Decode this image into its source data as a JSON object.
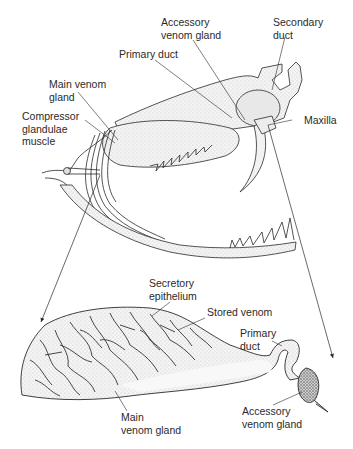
{
  "figure": {
    "top_panel": {
      "name": "Snake skull with venom apparatus",
      "labels": {
        "accessory_venom_gland": "Accessory\nvenom gland",
        "secondary_duct": "Secondary\nduct",
        "primary_duct": "Primary duct",
        "main_venom_gland": "Main venom\ngland",
        "compressor_muscle": "Compressor\nglandulae\nmuscle",
        "maxilla": "Maxilla"
      }
    },
    "bottom_panel": {
      "name": "Venom gland detail (enlarged)",
      "labels": {
        "secretory_epithelium": "Secretory\nepithelium",
        "stored_venom": "Stored venom",
        "primary_duct": "Primary\nduct",
        "main_venom_gland": "Main\nvenom gland",
        "accessory_venom_gland": "Accessory\nvenom gland"
      }
    },
    "colors": {
      "background": "#ffffff",
      "ink": "#2a2a2a",
      "stipple": "#bdbdbd",
      "gland_fill": "#e9e9e9"
    }
  }
}
